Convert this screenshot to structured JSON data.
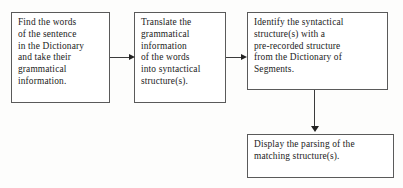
{
  "diagram": {
    "background_color": "#fdfdfc",
    "box_border_color": "#5a5a5a",
    "text_color": "#1c1c1c",
    "arrow_color": "#222222",
    "nodes": [
      {
        "id": "find",
        "text": "Find the words\nof the sentence\nin the Dictionary\nand take their\ngrammatical\ninformation."
      },
      {
        "id": "translate",
        "text": "Translate the\ngrammatical\ninformation\nof the words\ninto syntactical\nstructure(s)."
      },
      {
        "id": "identify",
        "text": "Identify the syntactical\nstructure(s) with a\npre-recorded structure\nfrom the Dictionary of\nSegments."
      },
      {
        "id": "display",
        "text": "Display the parsing of the\nmatching structure(s)."
      }
    ],
    "edges": [
      {
        "id": "edge1",
        "from": "find",
        "to": "translate",
        "direction": "right"
      },
      {
        "id": "edge2",
        "from": "translate",
        "to": "identify",
        "direction": "right"
      },
      {
        "id": "edge3",
        "from": "identify",
        "to": "display",
        "direction": "down"
      }
    ]
  }
}
